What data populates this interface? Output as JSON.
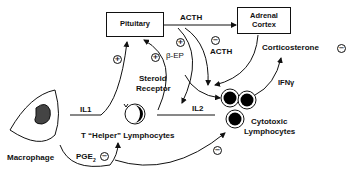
{
  "diagram": {
    "nodes": {
      "pituitary": {
        "label": "Pituitary"
      },
      "adrenal_cortex": {
        "line1": "Adrenal",
        "line2": "Cortex"
      },
      "macrophage": {
        "label": "Macrophage"
      },
      "t_helper": {
        "label": "T “Helper” Lymphocytes"
      },
      "steroid_receptor": {
        "line1": "Steroid",
        "line2": "Receptor"
      },
      "cytotoxic": {
        "line1": "Cytotoxic",
        "line2": "Lymphocytes"
      }
    },
    "edges": {
      "acth_top": {
        "label": "ACTH"
      },
      "acth_neg": {
        "label": "ACTH",
        "sign": "−"
      },
      "beta_ep": {
        "label": "β-EP",
        "sign": "+"
      },
      "il1": {
        "label": "IL1",
        "sign": "+"
      },
      "il2": {
        "label": "IL2"
      },
      "ifn": {
        "label": "IFNγ"
      },
      "corticosterone": {
        "label": "Corticosterone",
        "sign": "−"
      },
      "pge2": {
        "label_main": "PGE",
        "label_sub": "2",
        "sign": "−"
      },
      "pge2_to_cytotoxic": {
        "sign": "−"
      },
      "to_pituitary": {
        "sign": "+"
      }
    }
  }
}
